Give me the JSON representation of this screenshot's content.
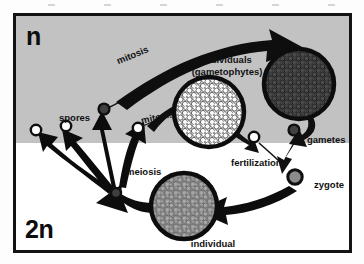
{
  "diagram": {
    "ploidy": {
      "haploid_label": "n",
      "diploid_label": "2n"
    },
    "colors": {
      "haploid_band": "#c2c2c2",
      "diploid_band": "#ffffff",
      "frame_border": "#131313",
      "ink": "#111111",
      "gametophyte_fill": "#fbfbfb",
      "gamete_producer_fill": "#4a4a4a",
      "sporophyte_fill": "#a6a6a6",
      "zygote_fill": "#8f8f8f"
    },
    "labels": {
      "mitosis_upper": "mitosis",
      "mitosis_lower": "mitosis",
      "individuals_line1": "individuals",
      "individuals_line2": "(gametophytes)",
      "spores": "spores",
      "gametes": "gametes",
      "fertilization": "fertilization",
      "meiosis": "meiosis",
      "zygote": "zygote",
      "individual_line1": "individual",
      "individual_line2": "(sporophyte)"
    },
    "structures": [
      {
        "name": "spore-left",
        "kind": "spore",
        "fill": "white",
        "cx": 20,
        "cy": 114,
        "r": 5
      },
      {
        "name": "spore-mid",
        "kind": "spore",
        "fill": "white",
        "cx": 50,
        "cy": 110,
        "r": 5
      },
      {
        "name": "spore-upper",
        "kind": "spore",
        "fill": "dark",
        "cx": 88,
        "cy": 93,
        "r": 5
      },
      {
        "name": "spore-right",
        "kind": "spore",
        "fill": "white",
        "cx": 122,
        "cy": 112,
        "r": 5
      },
      {
        "name": "spore-meiosis-origin",
        "kind": "spore",
        "fill": "dark",
        "cx": 100,
        "cy": 177,
        "r": 5
      },
      {
        "name": "gametophyte-colony",
        "kind": "colony",
        "fill": "light",
        "cx": 193,
        "cy": 96,
        "r": 35
      },
      {
        "name": "gamete-producing-colony",
        "kind": "colony",
        "fill": "dark",
        "cx": 283,
        "cy": 68,
        "r": 35
      },
      {
        "name": "gamete-small",
        "kind": "spore",
        "fill": "white",
        "cx": 238,
        "cy": 121,
        "r": 5
      },
      {
        "name": "gamete-large",
        "kind": "spore",
        "fill": "dark",
        "cx": 278,
        "cy": 114,
        "r": 5
      },
      {
        "name": "zygote-cell",
        "kind": "spore",
        "fill": "dark",
        "cx": 279,
        "cy": 161,
        "r": 7
      },
      {
        "name": "sporophyte-colony",
        "kind": "colony",
        "fill": "mid",
        "cx": 168,
        "cy": 190,
        "r": 33
      }
    ],
    "flows": [
      {
        "name": "spore-to-gametophyte-mitosis-upper",
        "from": "spore-upper",
        "to": "gamete-producing-colony",
        "label": "mitosis"
      },
      {
        "name": "spore-to-gametophyte-mitosis-lower",
        "from": "spore-right",
        "to": "gametophyte-colony",
        "label": "mitosis"
      },
      {
        "name": "gametophyte-to-gamete",
        "from": "gametophyte-colony",
        "to": "gamete-small",
        "label": ""
      },
      {
        "name": "colony-to-gamete",
        "from": "gamete-producing-colony",
        "to": "gamete-large",
        "label": ""
      },
      {
        "name": "gametes-to-zygote",
        "from": "gametes",
        "to": "zygote-cell",
        "label": "fertilization"
      },
      {
        "name": "zygote-to-sporophyte",
        "from": "zygote-cell",
        "to": "sporophyte-colony",
        "label": ""
      },
      {
        "name": "sporophyte-to-spore-cell",
        "from": "sporophyte-colony",
        "to": "spore-meiosis-origin",
        "label": ""
      },
      {
        "name": "meiosis-to-spores",
        "from": "spore-meiosis-origin",
        "to": "spores",
        "label": "meiosis"
      }
    ]
  }
}
